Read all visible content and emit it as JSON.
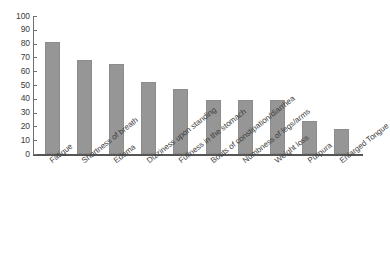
{
  "chart_data": {
    "type": "bar",
    "title": "",
    "subtitle": "",
    "xlabel": "",
    "ylabel": "",
    "ylim": [
      0,
      100
    ],
    "ytick_step": 10,
    "grid": false,
    "legend": false,
    "legend_position": "none",
    "bar_color": "#969696",
    "axis_color": "#555555",
    "categories": [
      "Fatigue",
      "Shortness of breath",
      "Edema",
      "Dizziness upon standing",
      "Fullness in the stomach",
      "Bouts of constipation/diarrhea",
      "Numbness of legs/arms",
      "Weight loss",
      "Purpura",
      "Enlarged Tongue"
    ],
    "values": [
      81,
      68,
      65,
      52,
      47,
      39,
      39,
      39,
      24,
      18
    ],
    "ytick_labels": [
      "100",
      "90",
      "80",
      "70",
      "60",
      "50",
      "40",
      "30",
      "20",
      "10",
      "0"
    ],
    "ytick_values": [
      100,
      90,
      80,
      70,
      60,
      50,
      40,
      30,
      20,
      10,
      0
    ]
  }
}
